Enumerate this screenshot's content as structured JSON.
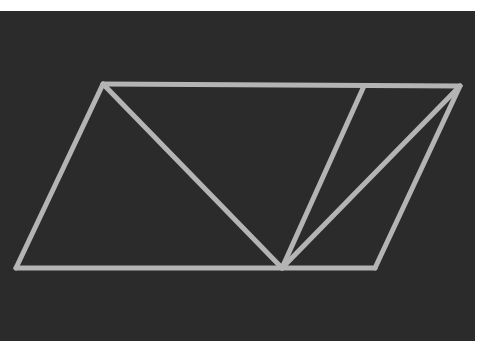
{
  "diagram": {
    "background_color": "#2b2b2b",
    "stroke_color": "#b4b4b4",
    "stroke_width": 5,
    "points": {
      "top_left": [
        103,
        84
      ],
      "top_inner": [
        364,
        86
      ],
      "top_right": [
        460,
        86
      ],
      "bottom_left": [
        16,
        268
      ],
      "bottom_mid": [
        282,
        268
      ],
      "bottom_right": [
        375,
        268
      ]
    },
    "segments": [
      {
        "name": "parallelogram-top-edge",
        "from": "top_left",
        "to": "top_right"
      },
      {
        "name": "parallelogram-right-edge",
        "from": "top_right",
        "to": "bottom_right"
      },
      {
        "name": "parallelogram-bottom-edge",
        "from": "bottom_right",
        "to": "bottom_left"
      },
      {
        "name": "parallelogram-left-edge",
        "from": "bottom_left",
        "to": "top_left"
      },
      {
        "name": "diagonal-top-left-to-bottom-mid",
        "from": "top_left",
        "to": "bottom_mid"
      },
      {
        "name": "segment-top-inner-to-bottom-mid",
        "from": "top_inner",
        "to": "bottom_mid"
      },
      {
        "name": "segment-top-right-to-bottom-mid",
        "from": "top_right",
        "to": "bottom_mid"
      }
    ]
  }
}
